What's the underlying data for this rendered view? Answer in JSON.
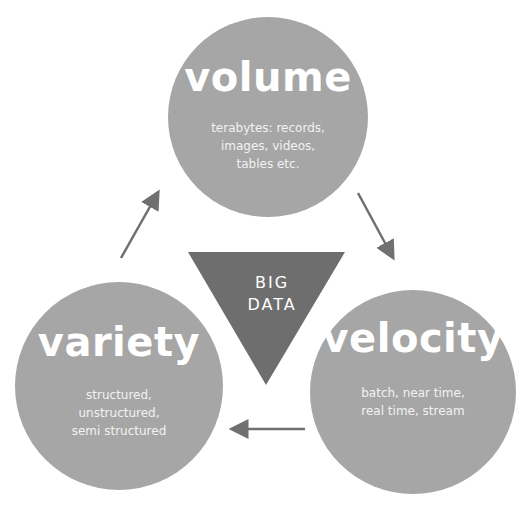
{
  "diagram": {
    "center": {
      "line1": "BIG",
      "line2": "DATA",
      "shape": "inverted-triangle",
      "color": "#6e6e6e"
    },
    "nodes": [
      {
        "id": "volume",
        "title": "volume",
        "lines": [
          "terabytes: records,",
          "images, videos,",
          "tables etc."
        ]
      },
      {
        "id": "velocity",
        "title": "velocity",
        "lines": [
          "batch, near time,",
          "real time, stream"
        ]
      },
      {
        "id": "variety",
        "title": "variety",
        "lines": [
          "structured,",
          "unstructured,",
          "semi structured"
        ]
      }
    ],
    "arrows": [
      {
        "from": "volume",
        "to": "velocity",
        "icon": "arrow-down-right-icon"
      },
      {
        "from": "velocity",
        "to": "variety",
        "icon": "arrow-left-icon"
      },
      {
        "from": "variety",
        "to": "volume",
        "icon": "arrow-up-right-icon"
      }
    ],
    "colors": {
      "circle": "#a6a6a6",
      "triangle": "#6e6e6e",
      "arrow": "#707070",
      "text": "#ffffff"
    }
  }
}
